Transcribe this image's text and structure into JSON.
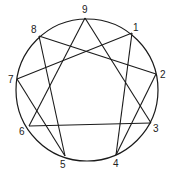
{
  "diagram": {
    "circle": {
      "cx": 87,
      "cy": 90,
      "r": 71
    },
    "stroke_color": "#1a1a1a",
    "points": [
      {
        "label": "9",
        "x": 85,
        "y": 18,
        "lx": 82,
        "ly": 13
      },
      {
        "label": "1",
        "x": 132,
        "y": 33,
        "lx": 133,
        "ly": 31
      },
      {
        "label": "2",
        "x": 156,
        "y": 74,
        "lx": 160,
        "ly": 78
      },
      {
        "label": "3",
        "x": 151,
        "y": 123,
        "lx": 153,
        "ly": 132
      },
      {
        "label": "4",
        "x": 116,
        "y": 155,
        "lx": 113,
        "ly": 167
      },
      {
        "label": "5",
        "x": 65,
        "y": 156,
        "lx": 60,
        "ly": 168
      },
      {
        "label": "6",
        "x": 29,
        "y": 126,
        "lx": 19,
        "ly": 135
      },
      {
        "label": "7",
        "x": 17,
        "y": 79,
        "lx": 8,
        "ly": 83
      },
      {
        "label": "8",
        "x": 39,
        "y": 36,
        "lx": 31,
        "ly": 33
      }
    ],
    "edges": [
      [
        "9",
        "3"
      ],
      [
        "3",
        "6"
      ],
      [
        "6",
        "9"
      ],
      [
        "1",
        "4"
      ],
      [
        "4",
        "2"
      ],
      [
        "2",
        "8"
      ],
      [
        "8",
        "5"
      ],
      [
        "5",
        "7"
      ],
      [
        "7",
        "1"
      ]
    ]
  }
}
